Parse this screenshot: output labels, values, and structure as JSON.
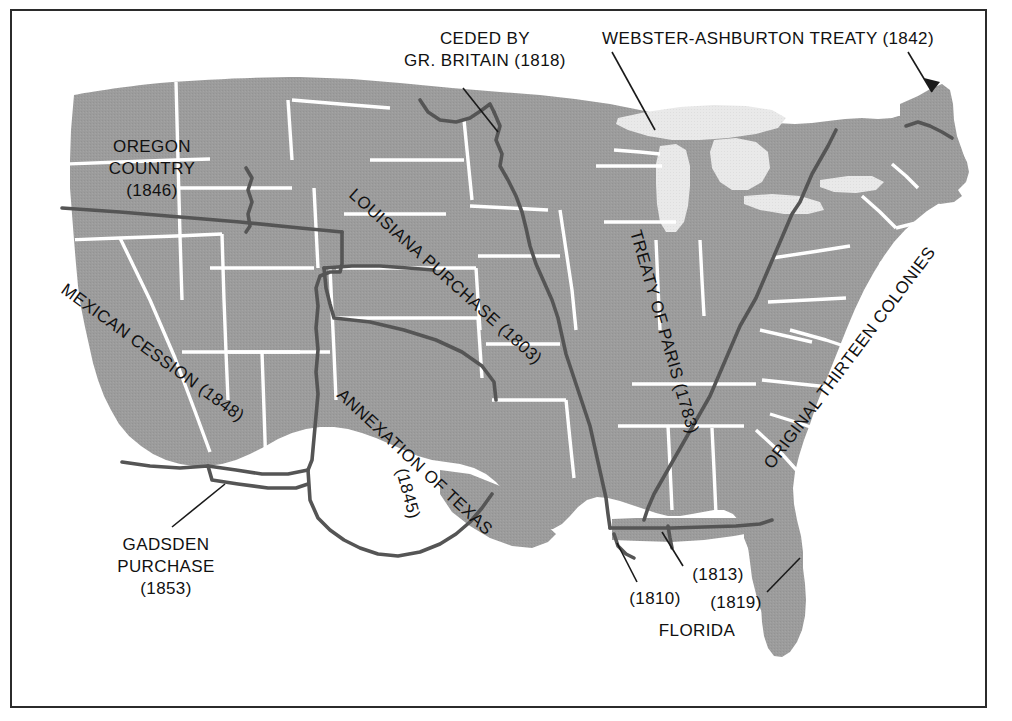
{
  "map": {
    "title": "United States Territorial Expansion",
    "colors": {
      "land": "#9c9c9c",
      "lakes": "#e9e9e9",
      "state_border": "#ffffff",
      "territory_border": "#555555",
      "frame": "#2b2b2b",
      "background": "#ffffff",
      "label_text": "#111111"
    }
  },
  "labels": {
    "ceded_by_britain": {
      "line1": "CEDED BY",
      "line2": "GR. BRITAIN (1818)"
    },
    "webster_ashburton": "WEBSTER-ASHBURTON TREATY (1842)",
    "oregon_country": {
      "line1": "OREGON",
      "line2": "COUNTRY",
      "line3": "(1846)"
    },
    "louisiana_purchase": "LOUISIANA PURCHASE (1803)",
    "mexican_cession": "MEXICAN CESSION (1848)",
    "annexation_of_texas": {
      "line1": "ANNEXATION OF TEXAS",
      "line2": "(1845)"
    },
    "treaty_of_paris": "TREATY OF PARIS (1783)",
    "original_thirteen_colonies": "ORIGINAL THIRTEEN COLONIES",
    "gadsden_purchase": {
      "line1": "GADSDEN",
      "line2": "PURCHASE",
      "line3": "(1853)"
    },
    "florida": {
      "name": "FLORIDA",
      "year_1810": "(1810)",
      "year_1813": "(1813)",
      "year_1819": "(1819)"
    }
  },
  "territories": [
    {
      "name": "Original Thirteen Colonies",
      "year": "1783"
    },
    {
      "name": "Treaty of Paris",
      "year": "1783"
    },
    {
      "name": "Louisiana Purchase",
      "year": "1803"
    },
    {
      "name": "West Florida",
      "year": "1810"
    },
    {
      "name": "Mobile District",
      "year": "1813"
    },
    {
      "name": "Ceded by Gr. Britain",
      "year": "1818"
    },
    {
      "name": "Florida",
      "year": "1819"
    },
    {
      "name": "Webster-Ashburton Treaty",
      "year": "1842"
    },
    {
      "name": "Annexation of Texas",
      "year": "1845"
    },
    {
      "name": "Oregon Country",
      "year": "1846"
    },
    {
      "name": "Mexican Cession",
      "year": "1848"
    },
    {
      "name": "Gadsden Purchase",
      "year": "1853"
    }
  ]
}
